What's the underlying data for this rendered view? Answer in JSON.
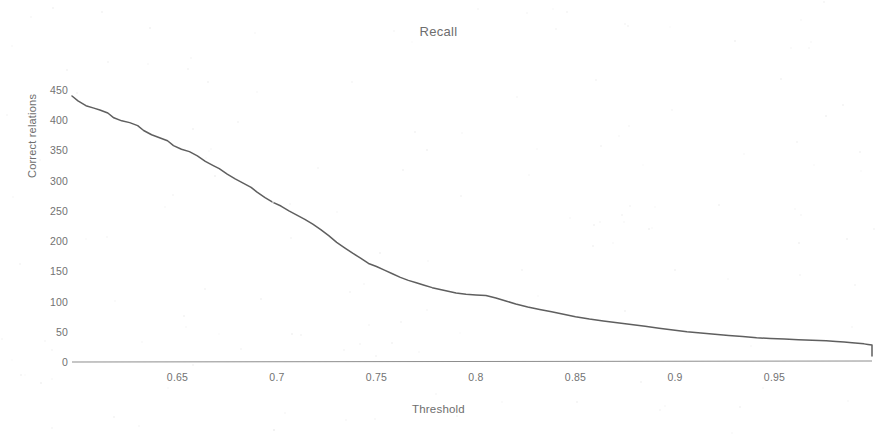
{
  "chart_data": {
    "type": "line",
    "title": "Recall",
    "xlabel": "Threshold",
    "ylabel": "Correct relations",
    "xlim": [
      0.597,
      0.999
    ],
    "ylim": [
      0,
      460
    ],
    "grid": false,
    "legend": null,
    "line_color": "#5f5f5f",
    "axis_color": "#8d8d8d",
    "background": "#ffffff",
    "x_ticks": [
      0.65,
      0.7,
      0.75,
      0.8,
      0.85,
      0.9,
      0.95
    ],
    "x_tick_labels": [
      "0.65",
      "0.7",
      "0.75",
      "0.8",
      "0.85",
      "0.9",
      "0.95"
    ],
    "y_ticks": [
      0,
      50,
      100,
      150,
      200,
      250,
      300,
      350,
      400,
      450
    ],
    "y_tick_labels": [
      "0",
      "50",
      "100",
      "150",
      "200",
      "250",
      "300",
      "350",
      "400",
      "450"
    ],
    "series": [
      {
        "name": "Correct relations",
        "x": [
          0.597,
          0.6,
          0.604,
          0.608,
          0.611,
          0.615,
          0.618,
          0.622,
          0.626,
          0.63,
          0.633,
          0.637,
          0.641,
          0.645,
          0.648,
          0.652,
          0.656,
          0.66,
          0.664,
          0.668,
          0.671,
          0.675,
          0.679,
          0.683,
          0.687,
          0.69,
          0.694,
          0.698,
          0.702,
          0.706,
          0.71,
          0.714,
          0.718,
          0.722,
          0.726,
          0.73,
          0.734,
          0.738,
          0.742,
          0.746,
          0.75,
          0.754,
          0.758,
          0.762,
          0.766,
          0.77,
          0.774,
          0.778,
          0.782,
          0.786,
          0.79,
          0.795,
          0.8,
          0.805,
          0.81,
          0.815,
          0.82,
          0.826,
          0.832,
          0.838,
          0.844,
          0.85,
          0.857,
          0.864,
          0.871,
          0.878,
          0.885,
          0.892,
          0.899,
          0.906,
          0.913,
          0.92,
          0.927,
          0.934,
          0.941,
          0.948,
          0.955,
          0.962,
          0.969,
          0.976,
          0.981,
          0.985,
          0.989,
          0.992,
          0.995,
          0.997,
          0.999
        ],
        "y": [
          440,
          432,
          424,
          420,
          417,
          412,
          404,
          399,
          396,
          391,
          383,
          376,
          371,
          366,
          358,
          352,
          348,
          341,
          332,
          325,
          320,
          311,
          303,
          296,
          289,
          281,
          272,
          264,
          258,
          250,
          243,
          236,
          228,
          219,
          209,
          198,
          189,
          180,
          172,
          163,
          158,
          152,
          146,
          140,
          135,
          131,
          127,
          123,
          120,
          117,
          114,
          112,
          111,
          110,
          106,
          101,
          96,
          91,
          87,
          83,
          79,
          75,
          71,
          68,
          65,
          62,
          59,
          56,
          53,
          50,
          48,
          46,
          44,
          42,
          40,
          39,
          38,
          37,
          36,
          35,
          34,
          33,
          32,
          31,
          30,
          29,
          28
        ]
      },
      {
        "name": "Correct relations (tail)",
        "x": [
          0.999
        ],
        "y": [
          10
        ]
      }
    ],
    "annotations": []
  }
}
